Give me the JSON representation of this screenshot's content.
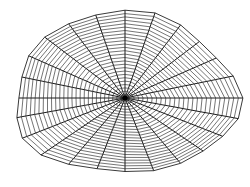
{
  "figure": {
    "type": "polar-wireframe-surface",
    "center": [
      125,
      98
    ],
    "radius_x": 112,
    "radius_top": 85,
    "radius_bottom": 76,
    "spoke_count": 24,
    "ring_count": 26,
    "line_color": "#1a1a1a",
    "ring_color": "#3a3a3a",
    "background": "#ffffff"
  }
}
